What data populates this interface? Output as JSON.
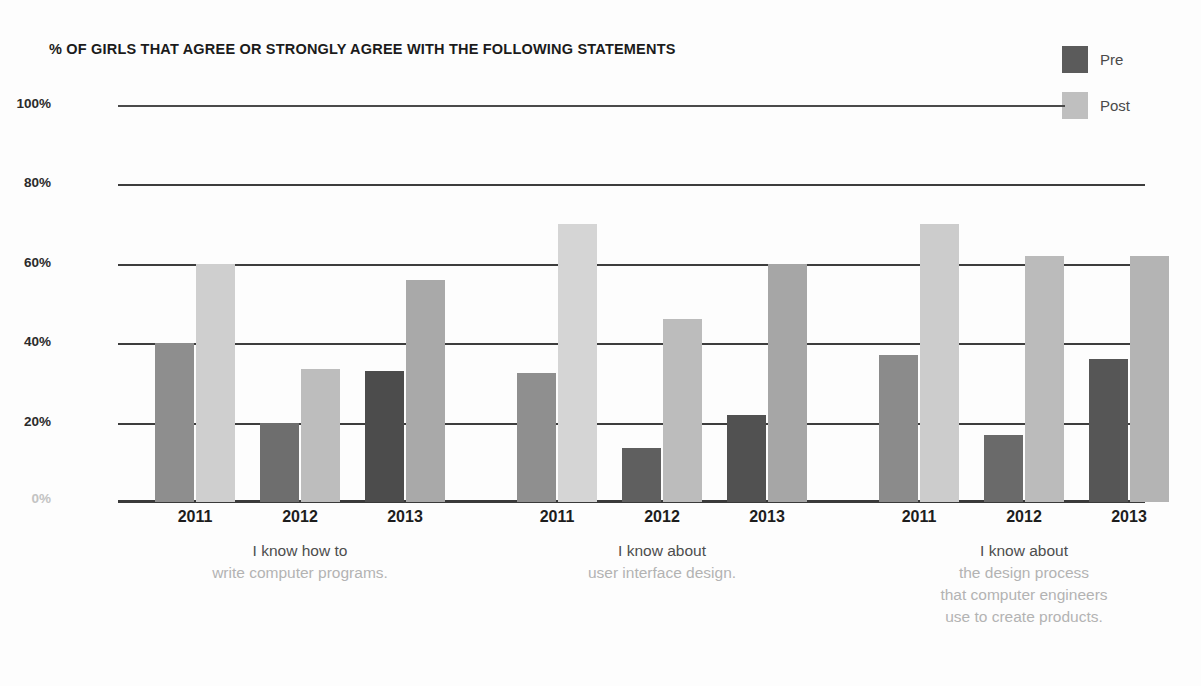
{
  "chart_data": {
    "type": "bar",
    "title": "% OF GIRLS THAT AGREE OR STRONGLY AGREE WITH THE FOLLOWING STATEMENTS",
    "xlabel": "",
    "ylabel": "",
    "ylim": [
      0,
      100
    ],
    "yticks": [
      "0%",
      "20%",
      "40%",
      "60%",
      "80%",
      "100%"
    ],
    "ytick_values": [
      0,
      20,
      40,
      60,
      80,
      100
    ],
    "grid": true,
    "legend_position": "top-right",
    "legend": [
      {
        "name": "Pre",
        "color": "#5b5b5b"
      },
      {
        "name": "Post",
        "color": "#bfbfbf"
      }
    ],
    "categories": [
      "2011",
      "2012",
      "2013"
    ],
    "groups": [
      {
        "caption_lead": "I know how to",
        "caption_rest": [
          "write computer programs."
        ],
        "series": [
          {
            "name": "Pre",
            "values": [
              40,
              20,
              33
            ]
          },
          {
            "name": "Post",
            "values": [
              60,
              33.5,
              56
            ]
          }
        ]
      },
      {
        "caption_lead": "I know about",
        "caption_rest": [
          "user interface design."
        ],
        "series": [
          {
            "name": "Pre",
            "values": [
              32.5,
              13.5,
              22
            ]
          },
          {
            "name": "Post",
            "values": [
              70,
              46,
              60
            ]
          }
        ]
      },
      {
        "caption_lead": "I know about",
        "caption_rest": [
          "the design process",
          "that computer engineers",
          "use to create products."
        ],
        "series": [
          {
            "name": "Pre",
            "values": [
              37,
              17,
              36
            ]
          },
          {
            "name": "Post",
            "values": [
              70,
              62,
              62
            ]
          }
        ]
      }
    ],
    "bar_shades": {
      "pre": [
        [
          "#8e8e8e",
          "#6e6e6e",
          "#4c4c4c"
        ],
        [
          "#8f8f8f",
          "#5f5f5f",
          "#515151"
        ],
        [
          "#8b8b8b",
          "#6a6a6a",
          "#565656"
        ]
      ],
      "post": [
        [
          "#cfcfcf",
          "#bdbdbd",
          "#a9a9a9"
        ],
        [
          "#d5d5d5",
          "#bcbcbc",
          "#a6a6a6"
        ],
        [
          "#cccccc",
          "#bbbbbb",
          "#b4b4b4"
        ]
      ]
    }
  }
}
